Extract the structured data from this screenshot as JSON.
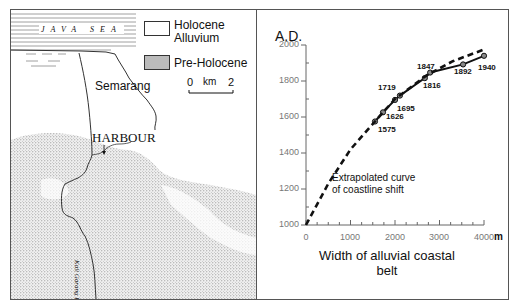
{
  "map": {
    "sea_label": "JAVA SEA",
    "city_label": "Semarang",
    "harbour_label": "HARBOUR",
    "river_label": "Kali Garang R.",
    "legend": [
      {
        "label_line1": "Holocene",
        "label_line2": "Alluvium",
        "pattern": "blank"
      },
      {
        "label_line1": "Pre-Holocene",
        "label_line2": "",
        "pattern": "stipple"
      }
    ],
    "scale": {
      "start": "0",
      "unit": "km",
      "end": "2"
    }
  },
  "chart_data": {
    "type": "line",
    "title": "",
    "ylabel": "A.D.",
    "xlabel": "Width of alluvial coastal belt",
    "xlabel_line1": "Width of alluvial coastal",
    "xlabel_line2": "belt",
    "x_unit": "m",
    "xlim": [
      0,
      4000
    ],
    "ylim": [
      1000,
      2000
    ],
    "x_ticks": [
      "0",
      "1000",
      "2000",
      "3000",
      "4000"
    ],
    "y_ticks": [
      "1000",
      "1200",
      "1400",
      "1600",
      "1800",
      "2000"
    ],
    "grid": false,
    "annotation": "Extrapolated curve of coastline shift",
    "annotation_line1": "Extrapolated curve",
    "annotation_line2": "of coastline shift",
    "series": [
      {
        "name": "Observed coastline positions",
        "style": "solid",
        "points": [
          {
            "x": 1550,
            "y": 1575,
            "label": "1575"
          },
          {
            "x": 1730,
            "y": 1626,
            "label": "1626"
          },
          {
            "x": 2000,
            "y": 1695,
            "label": "1695"
          },
          {
            "x": 2110,
            "y": 1719,
            "label": "1719"
          },
          {
            "x": 2670,
            "y": 1816,
            "label": "1816"
          },
          {
            "x": 2790,
            "y": 1847,
            "label": "1847"
          },
          {
            "x": 3530,
            "y": 1892,
            "label": "1892"
          },
          {
            "x": 4000,
            "y": 1940,
            "label": "1940"
          }
        ]
      },
      {
        "name": "Extrapolated curve of coastline shift",
        "style": "dashed",
        "points": [
          {
            "x": 0,
            "y": 1000
          },
          {
            "x": 500,
            "y": 1230
          },
          {
            "x": 1000,
            "y": 1420
          },
          {
            "x": 1550,
            "y": 1575
          },
          {
            "x": 2000,
            "y": 1700
          },
          {
            "x": 2700,
            "y": 1830
          },
          {
            "x": 3300,
            "y": 1910
          },
          {
            "x": 4000,
            "y": 1975
          }
        ]
      }
    ],
    "point_labels": {
      "p1575": "1575",
      "p1626": "1626",
      "p1695": "1695",
      "p1719": "1719",
      "p1816": "1816",
      "p1847": "1847",
      "p1892": "1892",
      "p1940": "1940"
    }
  }
}
